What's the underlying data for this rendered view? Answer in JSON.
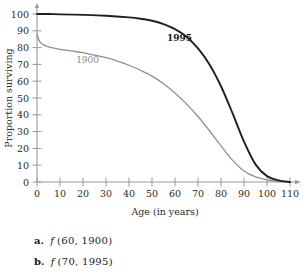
{
  "chart_data": {
    "type": "line",
    "title": "",
    "xlabel": "Age (in years)",
    "ylabel": "Proportion surviving",
    "xlim": [
      0,
      110
    ],
    "ylim": [
      0,
      100
    ],
    "xticks": [
      0,
      10,
      20,
      30,
      40,
      50,
      60,
      70,
      80,
      90,
      100,
      110
    ],
    "yticks": [
      0,
      10,
      20,
      30,
      40,
      50,
      60,
      70,
      80,
      90,
      100
    ],
    "grid": false,
    "legend_position": "inline-annotation",
    "annotations": [
      {
        "text": "1900",
        "x": 22,
        "y": 71,
        "color": "#8a8a8a",
        "bold": false
      },
      {
        "text": "1995",
        "x": 62,
        "y": 84,
        "color": "#1a1a1a",
        "bold": true
      }
    ],
    "series": [
      {
        "name": "1900",
        "color": "#8f8f8f",
        "x": [
          0,
          1,
          2,
          3,
          5,
          8,
          10,
          15,
          20,
          25,
          30,
          35,
          40,
          45,
          50,
          55,
          60,
          65,
          70,
          75,
          80,
          85,
          90,
          95,
          100,
          105,
          110
        ],
        "values": [
          88,
          84,
          82.5,
          81.5,
          80.5,
          79.5,
          79,
          78,
          77,
          75.5,
          74,
          72,
          69.5,
          66.5,
          63,
          58.5,
          53,
          46.5,
          39,
          30.5,
          21.5,
          13,
          6.5,
          3,
          1.2,
          0.4,
          0
        ]
      },
      {
        "name": "1995",
        "color": "#1f1f1f",
        "x": [
          0,
          5,
          10,
          20,
          30,
          40,
          45,
          50,
          55,
          60,
          65,
          70,
          75,
          80,
          85,
          90,
          95,
          100,
          105,
          110
        ],
        "values": [
          100,
          100,
          99.8,
          99.5,
          99,
          98,
          97.2,
          96,
          94,
          91,
          86.5,
          79.5,
          70,
          57,
          41,
          24,
          10.5,
          3.5,
          1,
          0
        ]
      }
    ]
  },
  "questions": [
    {
      "label": "a.",
      "fn": "f",
      "args": "(60, 1900)"
    },
    {
      "label": "b.",
      "fn": "f",
      "args": "(70, 1995)"
    }
  ]
}
